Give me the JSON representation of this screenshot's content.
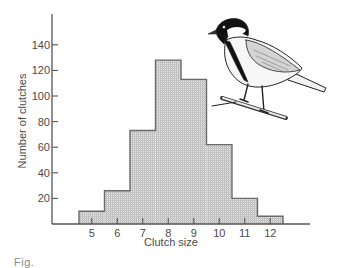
{
  "chart_data": {
    "type": "bar",
    "subtype": "histogram",
    "title": "",
    "xlabel": "Clutch size",
    "ylabel": "Number of clutches",
    "categories": [
      "5",
      "6",
      "7",
      "8",
      "9",
      "10",
      "11",
      "12"
    ],
    "values": [
      10,
      26,
      73,
      128,
      113,
      62,
      20,
      6
    ],
    "x_ticks": [
      "5",
      "6",
      "7",
      "8",
      "9",
      "10",
      "11",
      "12"
    ],
    "y_ticks": [
      "20",
      "40",
      "60",
      "80",
      "100",
      "120",
      "140"
    ],
    "ylim": [
      0,
      155
    ],
    "grid": false,
    "legend": null,
    "annotations": [
      "illustration of a great tit perched on a branch (top right)"
    ],
    "bar_fill": "#cfcfcf",
    "bar_outline": "#6a6a6a"
  },
  "caption_partial": "Fig."
}
